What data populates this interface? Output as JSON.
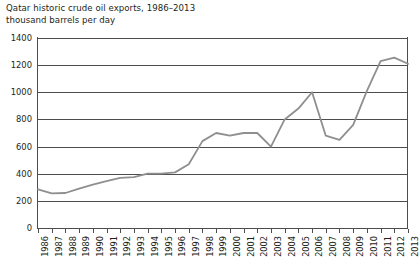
{
  "chart_data": {
    "type": "line",
    "title": "Qatar historic crude oil exports, 1986–2013",
    "subtitle": "thousand barrels per day",
    "xlabel": "",
    "ylabel": "thousand barrels per day",
    "ylim": [
      0,
      1400
    ],
    "ytick_step": 200,
    "yticks": [
      "1400",
      "1200",
      "1000",
      "800",
      "600",
      "400",
      "200",
      "0"
    ],
    "grid": "horizontal",
    "legend": "none",
    "line_color": "#8f8f8f",
    "axis_color": "#4d4d4d",
    "categories": [
      "1986",
      "1987",
      "1988",
      "1989",
      "1990",
      "1991",
      "1992",
      "1993",
      "1994",
      "1995",
      "1996",
      "1997",
      "1998",
      "1999",
      "2000",
      "2001",
      "2002",
      "2003",
      "2004",
      "2005",
      "2006",
      "2007",
      "2008",
      "2009",
      "2010",
      "2011",
      "2012",
      "2013"
    ],
    "series": [
      {
        "name": "Qatar crude oil exports",
        "values": [
          285,
          255,
          258,
          290,
          320,
          345,
          370,
          375,
          400,
          400,
          410,
          470,
          640,
          700,
          680,
          700,
          700,
          600,
          800,
          880,
          1000,
          680,
          650,
          760,
          1010,
          1230,
          1255,
          1210
        ]
      }
    ]
  }
}
